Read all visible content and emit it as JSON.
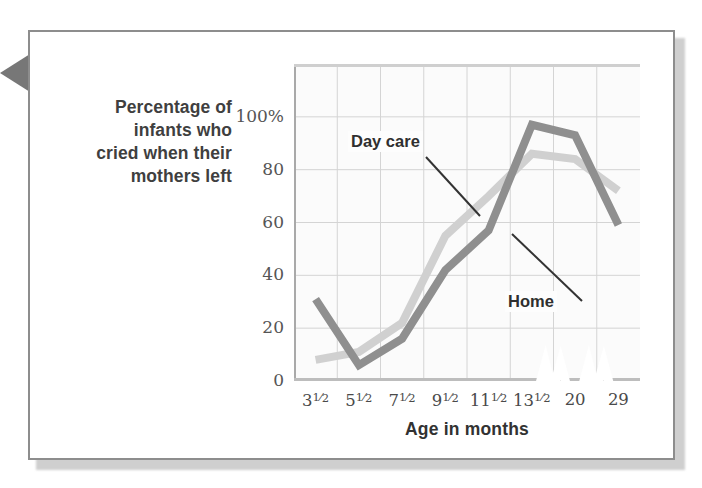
{
  "figure": {
    "pointer_tab_icon": "left-triangle-pointer-icon",
    "frame_border_color": "#8d8d8d",
    "background_color": "#ffffff"
  },
  "chart_data": {
    "type": "line",
    "title": "",
    "xlabel": "Age in months",
    "ylabel": "Percentage of infants who cried when their mothers left",
    "ylabel_lines": [
      "Percentage of",
      "infants who",
      "cried when their",
      "mothers left"
    ],
    "categories": [
      "3½",
      "5½",
      "7½",
      "9½",
      "11½",
      "13½",
      "20",
      "29"
    ],
    "category_parts": [
      {
        "whole": "3",
        "num": "1",
        "den": "2"
      },
      {
        "whole": "5",
        "num": "1",
        "den": "2"
      },
      {
        "whole": "7",
        "num": "1",
        "den": "2"
      },
      {
        "whole": "9",
        "num": "1",
        "den": "2"
      },
      {
        "whole": "11",
        "num": "1",
        "den": "2"
      },
      {
        "whole": "13",
        "num": "1",
        "den": "2"
      },
      {
        "whole": "20",
        "num": "",
        "den": ""
      },
      {
        "whole": "29",
        "num": "",
        "den": ""
      }
    ],
    "ylim": [
      0,
      120
    ],
    "yticks": [
      0,
      20,
      40,
      60,
      80,
      100
    ],
    "ytick_labels": [
      "0",
      "20",
      "40",
      "60",
      "80",
      "100%"
    ],
    "grid": true,
    "legend_position": "inline-annotations",
    "series": [
      {
        "name": "Home",
        "color": "#8f8f8f",
        "values": [
          31,
          6,
          16,
          42,
          57,
          97,
          93,
          59
        ]
      },
      {
        "name": "Day care",
        "color": "#d0d0d0",
        "values": [
          8,
          11,
          22,
          55,
          70,
          86,
          84,
          72
        ]
      }
    ],
    "annotations": [
      {
        "text": "Day care",
        "series": "Day care"
      },
      {
        "text": "Home",
        "series": "Home"
      }
    ],
    "axis_breaks": 2
  }
}
